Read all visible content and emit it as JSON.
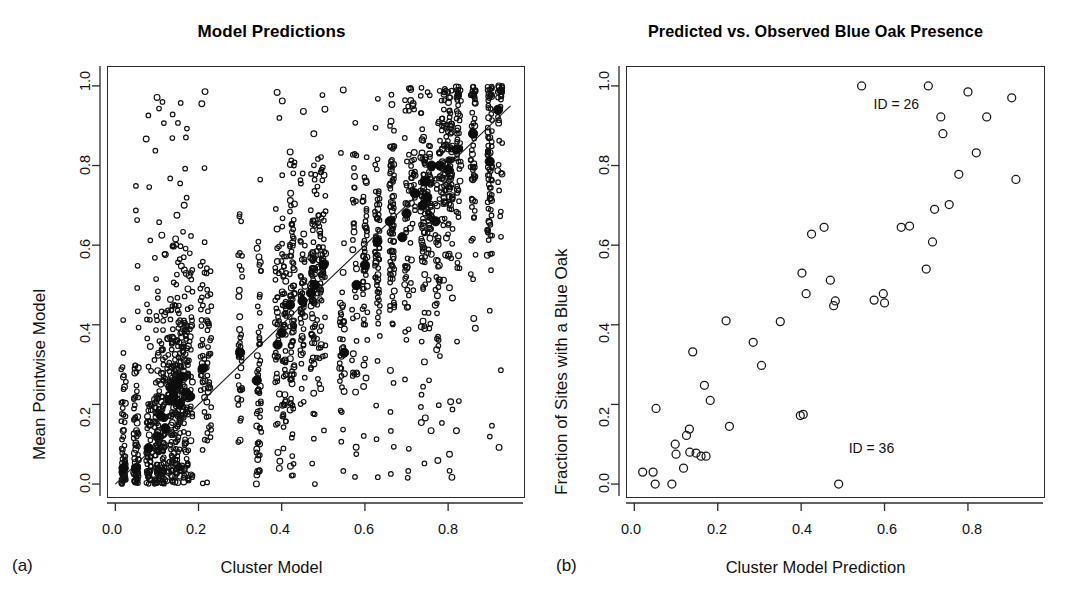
{
  "figure": {
    "panel_a_letter": "(a)",
    "panel_b_letter": "(b)"
  },
  "chart_data": [
    {
      "type": "scatter",
      "panel": "a",
      "title": "Model Predictions",
      "xlabel": "Cluster Model",
      "ylabel": "Mean Pointwise Model",
      "xlim": [
        -0.02,
        0.98
      ],
      "ylim": [
        -0.03,
        1.05
      ],
      "xticks": [
        0.0,
        0.2,
        0.4,
        0.6,
        0.8
      ],
      "xticklabels": [
        "0.0",
        "0.2",
        "0.4",
        "0.6",
        "0.8"
      ],
      "yticks": [
        0.0,
        0.2,
        0.4,
        0.6,
        0.8,
        1.0
      ],
      "yticklabels": [
        "0.0",
        "0.2",
        "0.4",
        "0.6",
        "0.8",
        "1.0"
      ],
      "grid": false,
      "legend": "none",
      "reference_line": {
        "type": "identity",
        "from": [
          0.0,
          0.0
        ],
        "to": [
          0.95,
          0.95
        ]
      },
      "series": [
        {
          "name": "cluster means",
          "marker": "filled-circle",
          "size": 9,
          "points": [
            [
              0.02,
              0.04
            ],
            [
              0.05,
              0.04
            ],
            [
              0.08,
              0.09
            ],
            [
              0.1,
              0.12
            ],
            [
              0.11,
              0.17
            ],
            [
              0.12,
              0.14
            ],
            [
              0.13,
              0.21
            ],
            [
              0.135,
              0.24
            ],
            [
              0.14,
              0.22
            ],
            [
              0.15,
              0.25
            ],
            [
              0.155,
              0.2
            ],
            [
              0.16,
              0.27
            ],
            [
              0.17,
              0.23
            ],
            [
              0.18,
              0.22
            ],
            [
              0.21,
              0.29
            ],
            [
              0.3,
              0.33
            ],
            [
              0.34,
              0.26
            ],
            [
              0.39,
              0.35
            ],
            [
              0.4,
              0.38
            ],
            [
              0.42,
              0.45
            ],
            [
              0.45,
              0.46
            ],
            [
              0.47,
              0.48
            ],
            [
              0.48,
              0.5
            ],
            [
              0.5,
              0.55
            ],
            [
              0.55,
              0.33
            ],
            [
              0.58,
              0.5
            ],
            [
              0.6,
              0.55
            ],
            [
              0.63,
              0.61
            ],
            [
              0.66,
              0.66
            ],
            [
              0.69,
              0.62
            ],
            [
              0.7,
              0.68
            ],
            [
              0.72,
              0.73
            ],
            [
              0.74,
              0.7
            ],
            [
              0.745,
              0.76
            ],
            [
              0.75,
              0.72
            ],
            [
              0.76,
              0.8
            ],
            [
              0.77,
              0.66
            ],
            [
              0.78,
              0.8
            ],
            [
              0.8,
              0.79
            ],
            [
              0.82,
              0.84
            ],
            [
              0.86,
              0.88
            ],
            [
              0.9,
              0.81
            ],
            [
              0.92,
              0.94
            ]
          ]
        },
        {
          "name": "pointwise predictions",
          "marker": "open-circle",
          "size": 2.4,
          "note": "Dense vertical strips of individual site predictions at each cluster x-value; approximately 1800 points.",
          "column_x": [
            0.02,
            0.05,
            0.08,
            0.1,
            0.115,
            0.13,
            0.14,
            0.15,
            0.16,
            0.17,
            0.18,
            0.21,
            0.225,
            0.3,
            0.345,
            0.39,
            0.405,
            0.425,
            0.45,
            0.475,
            0.49,
            0.5,
            0.545,
            0.575,
            0.6,
            0.63,
            0.665,
            0.7,
            0.715,
            0.74,
            0.755,
            0.775,
            0.79,
            0.805,
            0.825,
            0.86,
            0.9,
            0.925
          ],
          "y_range": [
            0.0,
            1.0
          ]
        }
      ]
    },
    {
      "type": "scatter",
      "panel": "b",
      "title": "Predicted vs. Observed Blue Oak Presence",
      "xlabel": "Cluster Model Prediction",
      "ylabel": "Fraction of Sites with a Blue Oak",
      "xlim": [
        -0.02,
        0.98
      ],
      "ylim": [
        -0.03,
        1.05
      ],
      "xticks": [
        0.0,
        0.2,
        0.4,
        0.6,
        0.8
      ],
      "xticklabels": [
        "0.0",
        "0.2",
        "0.4",
        "0.6",
        "0.8"
      ],
      "yticks": [
        0.0,
        0.2,
        0.4,
        0.6,
        0.8,
        1.0
      ],
      "yticklabels": [
        "0.0",
        "0.2",
        "0.4",
        "0.6",
        "0.8",
        "1.0"
      ],
      "grid": false,
      "legend": "none",
      "marker": "open-circle",
      "points": [
        [
          0.02,
          0.03
        ],
        [
          0.045,
          0.03
        ],
        [
          0.05,
          0.0
        ],
        [
          0.052,
          0.19
        ],
        [
          0.09,
          0.0
        ],
        [
          0.098,
          0.1
        ],
        [
          0.1,
          0.075
        ],
        [
          0.118,
          0.04
        ],
        [
          0.125,
          0.122
        ],
        [
          0.132,
          0.138
        ],
        [
          0.133,
          0.08
        ],
        [
          0.14,
          0.332
        ],
        [
          0.148,
          0.078
        ],
        [
          0.16,
          0.07
        ],
        [
          0.168,
          0.248
        ],
        [
          0.172,
          0.07
        ],
        [
          0.182,
          0.21
        ],
        [
          0.22,
          0.41
        ],
        [
          0.228,
          0.145
        ],
        [
          0.285,
          0.356
        ],
        [
          0.305,
          0.298
        ],
        [
          0.35,
          0.408
        ],
        [
          0.398,
          0.172
        ],
        [
          0.402,
          0.53
        ],
        [
          0.405,
          0.175
        ],
        [
          0.412,
          0.478
        ],
        [
          0.425,
          0.628
        ],
        [
          0.455,
          0.645
        ],
        [
          0.47,
          0.512
        ],
        [
          0.478,
          0.448
        ],
        [
          0.482,
          0.46
        ],
        [
          0.49,
          0.0
        ],
        [
          0.545,
          1.0
        ],
        [
          0.575,
          0.462
        ],
        [
          0.597,
          0.478
        ],
        [
          0.6,
          0.455
        ],
        [
          0.64,
          0.645
        ],
        [
          0.66,
          0.648
        ],
        [
          0.7,
          0.54
        ],
        [
          0.705,
          1.0
        ],
        [
          0.715,
          0.608
        ],
        [
          0.72,
          0.69
        ],
        [
          0.735,
          0.922
        ],
        [
          0.74,
          0.88
        ],
        [
          0.755,
          0.702
        ],
        [
          0.778,
          0.778
        ],
        [
          0.8,
          0.985
        ],
        [
          0.82,
          0.832
        ],
        [
          0.845,
          0.922
        ],
        [
          0.905,
          0.97
        ],
        [
          0.915,
          0.765
        ]
      ],
      "annotations": [
        {
          "text": "ID = 26",
          "x": 0.545,
          "y": 0.955,
          "points_to": [
            0.545,
            1.0
          ]
        },
        {
          "text": "ID = 36",
          "x": 0.49,
          "y": 0.055,
          "points_to": [
            0.49,
            0.0
          ]
        }
      ]
    }
  ]
}
